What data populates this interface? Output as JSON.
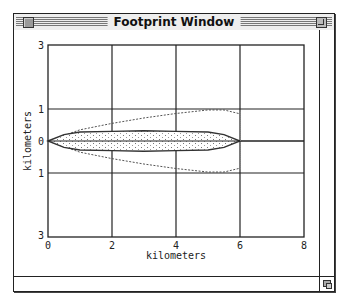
{
  "window": {
    "title": "Footprint Window"
  },
  "chart_data": {
    "type": "line",
    "title": "",
    "xlabel": "kilometers",
    "ylabel": "kilometers",
    "xlim": [
      0,
      8
    ],
    "ylim": [
      -3,
      3
    ],
    "x_ticks": [
      "0",
      "2",
      "4",
      "6",
      "8"
    ],
    "y_ticks": [
      "3",
      "1",
      "0",
      "1",
      "3"
    ],
    "y_tick_values": [
      3,
      1,
      0,
      -1,
      -3
    ],
    "grid": true,
    "series": [
      {
        "name": "outer-footprint (dashed)",
        "style": "dashed",
        "x": [
          0,
          1,
          2,
          3,
          4,
          5,
          5.5,
          6
        ],
        "upper": [
          0,
          0.35,
          0.55,
          0.72,
          0.86,
          0.97,
          0.97,
          0.85
        ],
        "lower": [
          0,
          -0.35,
          -0.55,
          -0.72,
          -0.86,
          -0.97,
          -0.97,
          -0.85
        ]
      },
      {
        "name": "inner-footprint (solid, dotted fill)",
        "style": "solid-filled",
        "x": [
          0,
          0.5,
          1,
          2,
          3,
          4,
          5,
          5.5,
          6
        ],
        "upper": [
          0,
          0.2,
          0.28,
          0.3,
          0.32,
          0.3,
          0.28,
          0.2,
          0
        ],
        "lower": [
          0,
          -0.2,
          -0.28,
          -0.3,
          -0.32,
          -0.3,
          -0.28,
          -0.2,
          0
        ]
      }
    ]
  }
}
